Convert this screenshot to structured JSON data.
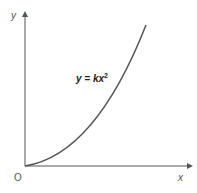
{
  "diagram": {
    "title": "",
    "y_axis_label": "y",
    "x_axis_label": "x",
    "origin_label": "O",
    "equation": {
      "lhs": "y = kx",
      "exponent": "2"
    },
    "curve": "parabola y = kx^2 for x >= 0",
    "colors": {
      "axis": "#555555",
      "curve": "#555555",
      "text": "#222222"
    }
  }
}
